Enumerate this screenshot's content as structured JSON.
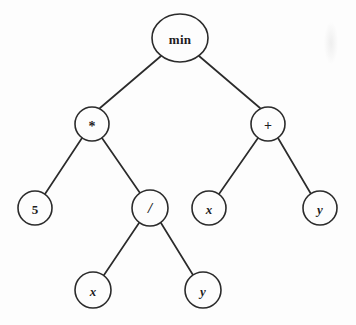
{
  "diagram": {
    "type": "binary-expression-tree",
    "expression": "min(5 * (x / y), x + y)",
    "background_color": "#fdfdfd",
    "stroke_color": "#2b2b2b",
    "text_color": "#1d1d1d",
    "artifact_label": "scan-smudge"
  },
  "nodes": [
    {
      "id": "n0",
      "label": "min",
      "role": "root-function",
      "shape": "ellipse",
      "cx": 180,
      "cy": 38,
      "rx": 28,
      "ry": 24
    },
    {
      "id": "n1",
      "label": "*",
      "role": "operator",
      "shape": "circle",
      "cx": 92,
      "cy": 124,
      "r": 17
    },
    {
      "id": "n2",
      "label": "+",
      "role": "operator",
      "shape": "circle",
      "cx": 268,
      "cy": 124,
      "r": 17
    },
    {
      "id": "n3",
      "label": "5",
      "role": "constant",
      "shape": "circle",
      "cx": 35,
      "cy": 208,
      "r": 17
    },
    {
      "id": "n4",
      "label": "/",
      "role": "operator",
      "shape": "circle",
      "cx": 150,
      "cy": 208,
      "r": 18
    },
    {
      "id": "n5",
      "label": "x",
      "role": "variable",
      "shape": "circle",
      "cx": 209,
      "cy": 208,
      "r": 17
    },
    {
      "id": "n6",
      "label": "y",
      "role": "variable",
      "shape": "circle",
      "cx": 320,
      "cy": 208,
      "r": 17
    },
    {
      "id": "n7",
      "label": "x",
      "role": "variable",
      "shape": "circle",
      "cx": 93,
      "cy": 290,
      "r": 18
    },
    {
      "id": "n8",
      "label": "y",
      "role": "variable",
      "shape": "circle",
      "cx": 203,
      "cy": 290,
      "r": 18
    }
  ],
  "edges": [
    {
      "id": "e0",
      "from": "n0",
      "to": "n1",
      "x1": 161,
      "y1": 56,
      "x2": 100,
      "y2": 108
    },
    {
      "id": "e1",
      "from": "n0",
      "to": "n2",
      "x1": 199,
      "y1": 56,
      "x2": 260,
      "y2": 108
    },
    {
      "id": "e2",
      "from": "n1",
      "to": "n3",
      "x1": 82,
      "y1": 138,
      "x2": 45,
      "y2": 194
    },
    {
      "id": "e3",
      "from": "n1",
      "to": "n4",
      "x1": 102,
      "y1": 138,
      "x2": 140,
      "y2": 193
    },
    {
      "id": "e4",
      "from": "n2",
      "to": "n5",
      "x1": 258,
      "y1": 138,
      "x2": 219,
      "y2": 194
    },
    {
      "id": "e5",
      "from": "n2",
      "to": "n6",
      "x1": 278,
      "y1": 138,
      "x2": 311,
      "y2": 194
    },
    {
      "id": "e6",
      "from": "n4",
      "to": "n7",
      "x1": 139,
      "y1": 223,
      "x2": 104,
      "y2": 275
    },
    {
      "id": "e7",
      "from": "n4",
      "to": "n8",
      "x1": 161,
      "y1": 223,
      "x2": 193,
      "y2": 275
    }
  ]
}
